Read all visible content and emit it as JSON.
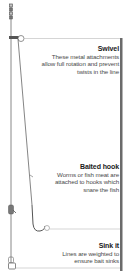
{
  "diagram": {
    "colors": {
      "line": "#6a6a6a",
      "accent_bar": "#6b6b6b",
      "leader": "#b8b8b8",
      "title_text": "#1a1a1a",
      "body_text": "#4a4a4a"
    },
    "callouts": [
      {
        "id": "swivel",
        "title": "Swivel",
        "description": "These metal attachments allow full rotation and prevent twists in the line"
      },
      {
        "id": "baited-hook",
        "title": "Baited hook",
        "description": "Worms or fish meat are attached to hooks which snare the fish"
      },
      {
        "id": "sink-it",
        "title": "Sink it",
        "description": "Lines are weighted to ensure bait sinks"
      }
    ]
  }
}
